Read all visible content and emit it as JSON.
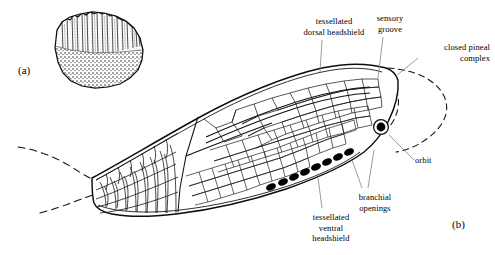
{
  "figure": {
    "type": "scientific-illustration",
    "background_color": "#ffffff",
    "ink_color": "#000000",
    "leader_color": "#8a8a8a",
    "panels": [
      {
        "tag": "(a)",
        "name": "fossil-specimen-photograph",
        "description": "stippled drawing of fossil bone fragment with vertical striations above and dense tubercle stippling below"
      },
      {
        "tag": "(b)",
        "name": "reconstruction-drawing",
        "description": "lateral reconstruction of tessellated headshield and scaled body"
      }
    ],
    "panel_a_tag": "(a)",
    "panel_b_tag": "(b)"
  },
  "labels": [
    {
      "id": "dorsal-headshield",
      "text": "tessellated\ndorsal headshield",
      "align": "center",
      "x": 296,
      "y": 16,
      "w": 76
    },
    {
      "id": "sensory-groove",
      "text": "sensory\ngroove",
      "align": "center",
      "x": 368,
      "y": 13,
      "w": 44
    },
    {
      "id": "pineal-complex",
      "text": "closed pineal\ncomplex",
      "align": "right",
      "x": 412,
      "y": 42,
      "w": 78
    },
    {
      "id": "orbit",
      "text": "orbit",
      "align": "left",
      "x": 415,
      "y": 155,
      "w": 34
    },
    {
      "id": "branchial-openings",
      "text": "branchial\nopenings",
      "align": "center",
      "x": 348,
      "y": 192,
      "w": 54
    },
    {
      "id": "ventral-headshield",
      "text": "tessellated\nventral\nheadshield",
      "align": "center",
      "x": 296,
      "y": 212,
      "w": 70
    }
  ],
  "anatomy": {
    "orbit": {
      "name": "orbit",
      "cx": 381,
      "cy": 127,
      "r_outer": 7.2,
      "r_inner": 4.4,
      "fill": "#000000"
    },
    "branchial_openings_count": 8,
    "branchial_openings": [
      {
        "cx": 349,
        "cy": 152
      },
      {
        "cx": 338,
        "cy": 157
      },
      {
        "cx": 327,
        "cy": 162
      },
      {
        "cx": 316,
        "cy": 167
      },
      {
        "cx": 305,
        "cy": 172
      },
      {
        "cx": 294,
        "cy": 177
      },
      {
        "cx": 283,
        "cy": 182
      },
      {
        "cx": 271,
        "cy": 187
      }
    ],
    "reconstructed_outline_style": "dashed",
    "preserved_outline_style": "solid"
  }
}
